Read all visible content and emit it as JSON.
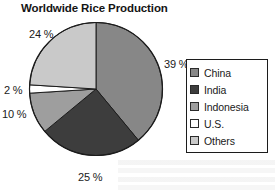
{
  "chart_data": {
    "type": "pie",
    "title": "Worldwide Rice Production",
    "categories": [
      "China",
      "India",
      "Indonesia",
      "U.S.",
      "Others"
    ],
    "values": [
      39,
      25,
      10,
      2,
      24
    ],
    "value_labels": [
      "39 %",
      "25 %",
      "10 %",
      "2 %",
      "24 %"
    ],
    "unit": "%",
    "xlabel": "",
    "ylabel": "",
    "legend_position": "right",
    "grid": false,
    "colors": [
      "#878787",
      "#3d3d3d",
      "#9e9e9e",
      "#ffffff",
      "#c9c9c9"
    ],
    "slice_colors": {
      "china": "#878787",
      "india": "#3d3d3d",
      "indonesia": "#9e9e9e",
      "us": "#ffffff",
      "others": "#c9c9c9"
    },
    "outline_color": "#1c1c1c",
    "start_angle_deg": 0,
    "direction": "clockwise"
  },
  "legend": {
    "items": [
      {
        "label": "China",
        "color": "#878787"
      },
      {
        "label": "India",
        "color": "#3d3d3d"
      },
      {
        "label": "Indonesia",
        "color": "#9e9e9e"
      },
      {
        "label": "U.S.",
        "color": "#ffffff"
      },
      {
        "label": "Others",
        "color": "#c9c9c9"
      }
    ]
  }
}
